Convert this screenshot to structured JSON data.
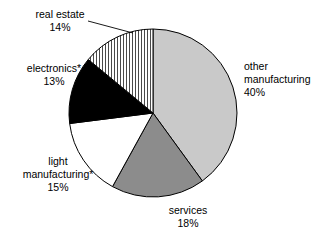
{
  "chart_data": {
    "type": "pie",
    "title": "",
    "subtitle": "",
    "xlabel": "",
    "ylabel": "",
    "legend_position": "none",
    "grid": false,
    "start_angle_deg": 0,
    "direction": "clockwise",
    "categories": [
      "other manufacturing",
      "services",
      "light manufacturing*",
      "electronics*",
      "real estate"
    ],
    "values": [
      40,
      18,
      15,
      13,
      14
    ],
    "value_labels": [
      "40%",
      "18%",
      "15%",
      "13%",
      "14%"
    ],
    "slices": [
      {
        "label": "other manufacturing",
        "label_line1": "other",
        "label_line2": "manufacturing",
        "value": 40,
        "value_label": "40%",
        "fill": "#c9c9c9",
        "pattern": "solid",
        "stroke": "#000000"
      },
      {
        "label": "services",
        "label_line1": "services",
        "label_line2": "",
        "value": 18,
        "value_label": "18%",
        "fill": "#8c8c8c",
        "pattern": "solid",
        "stroke": "#000000"
      },
      {
        "label": "light manufacturing*",
        "label_line1": "light",
        "label_line2": "manufacturing*",
        "value": 15,
        "value_label": "15%",
        "fill": "#ffffff",
        "pattern": "solid",
        "stroke": "#000000"
      },
      {
        "label": "electronics*",
        "label_line1": "electronics*",
        "label_line2": "",
        "value": 13,
        "value_label": "13%",
        "fill": "#000000",
        "pattern": "solid",
        "stroke": "#000000"
      },
      {
        "label": "real estate",
        "label_line1": "real estate",
        "label_line2": "",
        "value": 14,
        "value_label": "14%",
        "fill": "#ffffff",
        "pattern": "vertical-stripes",
        "stroke": "#000000"
      }
    ],
    "total": 100,
    "units": "percent",
    "footnote_marker": "*"
  },
  "geometry": {
    "center_x": 153,
    "center_y": 113,
    "radius": 84
  },
  "colors": {
    "background": "#ffffff",
    "outline": "#000000",
    "light_gray": "#c9c9c9",
    "mid_gray": "#8c8c8c",
    "black": "#000000",
    "white": "#ffffff"
  }
}
